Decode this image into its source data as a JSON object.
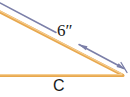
{
  "diagram": {
    "kind": "geometry-triangle-dimension-diagram",
    "background_color": "#FFFFFF",
    "colors": {
      "shape_stroke": "#E8A84E",
      "shape_stroke_light": "#F0C27E",
      "dimension_line": "#7B7FA8",
      "label_text": "#1A1A1A"
    },
    "labels": {
      "hypotenuse_length": "6″",
      "base_side": "C"
    },
    "shape": {
      "name": "triangle",
      "vertex_right": {
        "x": 122,
        "y": 75
      },
      "upper_side_from": {
        "x": 0,
        "y": 12
      },
      "base_side_from": {
        "x": 0,
        "y": 75
      }
    },
    "dimension": {
      "name": "hypotenuse-dimension-line",
      "from": {
        "x": 0,
        "y": 3
      },
      "to": {
        "x": 124,
        "y": 69
      },
      "arrowheads": "both-ends",
      "label_gap": {
        "x1": 55,
        "x2": 80
      }
    }
  }
}
